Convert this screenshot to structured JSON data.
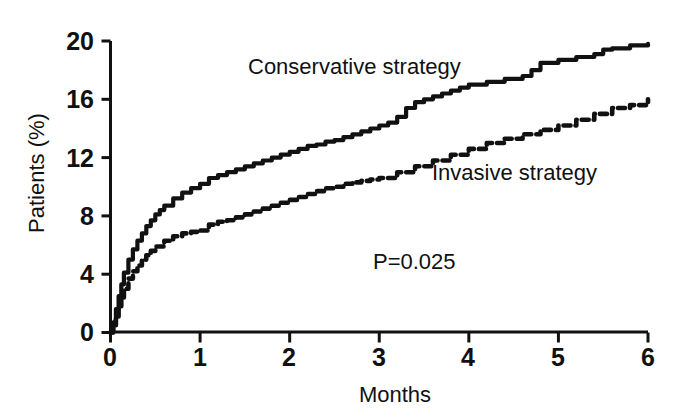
{
  "chart_data": {
    "type": "line",
    "title": "",
    "subtitle": "",
    "xlabel": "Months",
    "ylabel": "Patients (%)",
    "xlim": [
      0,
      6
    ],
    "ylim": [
      0,
      20
    ],
    "xticks": [
      "0",
      "1",
      "2",
      "3",
      "4",
      "5",
      "6"
    ],
    "yticks": [
      "0",
      "4",
      "8",
      "12",
      "16",
      "20"
    ],
    "grid": false,
    "legend_position": "inline-annotations",
    "annotations": [
      {
        "text": "Conservative strategy",
        "x": 1.6,
        "y": 17.8
      },
      {
        "text": "Invasive strategy",
        "x": 3.7,
        "y": 10.8
      },
      {
        "text": "P=0.025",
        "x": 3.0,
        "y": 4.8
      }
    ],
    "series": [
      {
        "name": "Conservative strategy",
        "style": "solid",
        "color": "#111111",
        "x": [
          0,
          0.03,
          0.06,
          0.09,
          0.12,
          0.15,
          0.2,
          0.25,
          0.3,
          0.35,
          0.4,
          0.45,
          0.5,
          0.55,
          0.6,
          0.7,
          0.8,
          0.9,
          1.0,
          1.1,
          1.2,
          1.3,
          1.4,
          1.5,
          1.6,
          1.7,
          1.8,
          1.9,
          2.0,
          2.1,
          2.2,
          2.3,
          2.4,
          2.5,
          2.6,
          2.7,
          2.8,
          2.9,
          3.0,
          3.1,
          3.2,
          3.3,
          3.4,
          3.5,
          3.6,
          3.7,
          3.8,
          3.9,
          4.0,
          4.2,
          4.4,
          4.6,
          4.7,
          4.8,
          5.0,
          5.2,
          5.4,
          5.5,
          5.6,
          5.8,
          6.0
        ],
        "y": [
          0,
          0.7,
          1.6,
          2.5,
          3.3,
          4.1,
          5.0,
          5.7,
          6.3,
          6.8,
          7.3,
          7.7,
          8.1,
          8.4,
          8.7,
          9.2,
          9.6,
          9.9,
          10.2,
          10.6,
          10.8,
          11.0,
          11.2,
          11.4,
          11.6,
          11.8,
          12.0,
          12.2,
          12.4,
          12.6,
          12.8,
          12.9,
          13.1,
          13.2,
          13.4,
          13.6,
          13.8,
          14.0,
          14.2,
          14.4,
          14.8,
          15.4,
          15.8,
          16.0,
          16.2,
          16.4,
          16.6,
          16.8,
          17.0,
          17.2,
          17.4,
          17.6,
          18.0,
          18.5,
          18.7,
          18.9,
          19.1,
          19.4,
          19.5,
          19.7,
          19.8
        ]
      },
      {
        "name": "Invasive strategy",
        "style": "dashed",
        "color": "#111111",
        "x": [
          0,
          0.03,
          0.06,
          0.09,
          0.12,
          0.15,
          0.2,
          0.25,
          0.3,
          0.35,
          0.4,
          0.45,
          0.5,
          0.6,
          0.7,
          0.8,
          0.9,
          1.0,
          1.1,
          1.2,
          1.3,
          1.4,
          1.5,
          1.6,
          1.7,
          1.8,
          1.9,
          2.0,
          2.1,
          2.2,
          2.3,
          2.4,
          2.5,
          2.6,
          2.7,
          2.8,
          2.9,
          3.0,
          3.2,
          3.4,
          3.6,
          3.8,
          4.0,
          4.2,
          4.4,
          4.6,
          4.8,
          5.0,
          5.2,
          5.4,
          5.6,
          5.8,
          6.0
        ],
        "y": [
          0,
          0.5,
          1.1,
          1.8,
          2.4,
          3.0,
          3.7,
          4.2,
          4.6,
          5.0,
          5.3,
          5.6,
          5.9,
          6.3,
          6.6,
          6.8,
          6.9,
          7.0,
          7.4,
          7.6,
          7.7,
          7.9,
          8.1,
          8.3,
          8.5,
          8.7,
          8.9,
          9.1,
          9.3,
          9.5,
          9.7,
          9.9,
          10.0,
          10.2,
          10.3,
          10.4,
          10.5,
          10.6,
          11.0,
          11.4,
          11.8,
          12.2,
          12.6,
          13.0,
          13.3,
          13.6,
          13.9,
          14.2,
          14.6,
          15.0,
          15.4,
          15.6,
          16.0
        ]
      }
    ]
  },
  "axes": {
    "ylabel": "Patients (%)",
    "xlabel": "Months",
    "yticks": [
      "20",
      "16",
      "12",
      "8",
      "4",
      "0"
    ],
    "xticks": [
      "0",
      "1",
      "2",
      "3",
      "4",
      "5",
      "6"
    ]
  },
  "annotations": {
    "conservative": "Conservative strategy",
    "invasive": "Invasive strategy",
    "pvalue": "P=0.025"
  }
}
